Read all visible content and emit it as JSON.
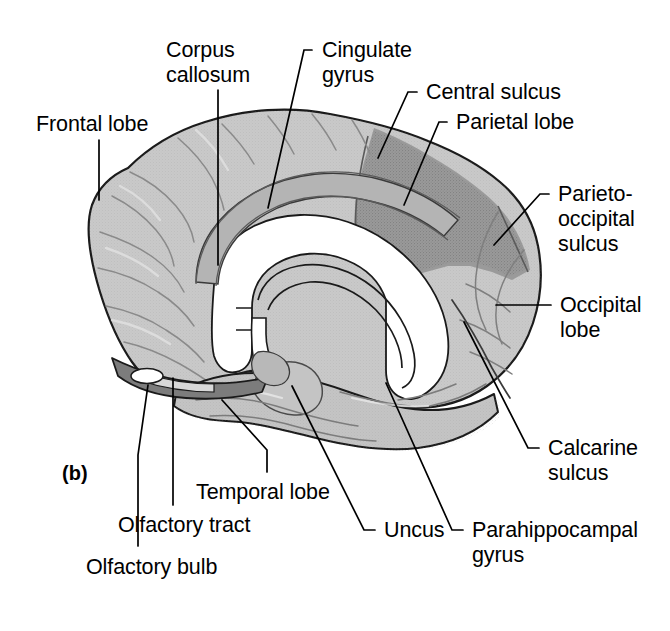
{
  "figure": {
    "panel_tag": "(b)",
    "background_color": "#ffffff"
  },
  "palette": {
    "outline": "#1a1a1a",
    "cortex_light": "#c9c9c9",
    "cortex_mid": "#bdbdbd",
    "parietal_dark": "#9a9a9a",
    "cingulate_band": "#b4b4b4",
    "white_matter": "#ffffff",
    "orbital_dark": "#7c7c7c",
    "sulcus_line": "#4a4a4a",
    "label_text": "#000000",
    "leader_line": "#000000"
  },
  "labels": [
    {
      "id": "frontal-lobe",
      "text": "Frontal lobe",
      "x": 36,
      "y": 112,
      "leader": "M 99,140 L 99,200"
    },
    {
      "id": "corpus-callosum",
      "text": "Corpus\ncallosum",
      "x": 166,
      "y": 38,
      "leader": "M 218,90 L 218,265"
    },
    {
      "id": "cingulate-gyrus",
      "text": "Cingulate\ngyrus",
      "x": 322,
      "y": 38,
      "leader": "M 312,50 L 304,50 L 268,208"
    },
    {
      "id": "central-sulcus",
      "text": "Central sulcus",
      "x": 426,
      "y": 80,
      "leader": "M 417,92 L 408,92 L 378,158"
    },
    {
      "id": "parietal-lobe",
      "text": "Parietal lobe",
      "x": 456,
      "y": 110,
      "leader": "M 447,122 L 439,122 L 404,205"
    },
    {
      "id": "parieto-occipital-sulcus",
      "text": "Parieto-\noccipital\nsulcus",
      "x": 558,
      "y": 182,
      "leader": "M 549,194 L 540,194 L 494,245"
    },
    {
      "id": "occipital-lobe",
      "text": "Occipital\nlobe",
      "x": 560,
      "y": 293,
      "leader": "M 551,305 L 496,305"
    },
    {
      "id": "calcarine-sulcus",
      "text": "Calcarine\nsulcus",
      "x": 548,
      "y": 436,
      "leader": "M 539,448 L 528,448 L 464,322"
    },
    {
      "id": "parahippocampal-gyrus",
      "text": "Parahippocampal\ngyrus",
      "x": 472,
      "y": 518,
      "leader": "M 463,530 L 452,530 L 386,383"
    },
    {
      "id": "uncus",
      "text": "Uncus",
      "x": 384,
      "y": 518,
      "leader": "M 375,530 L 364,530 L 292,386"
    },
    {
      "id": "temporal-lobe",
      "text": "Temporal lobe",
      "x": 196,
      "y": 480,
      "leader": "M 267,472 L 267,450 L 222,400"
    },
    {
      "id": "olfactory-tract",
      "text": "Olfactory tract",
      "x": 118,
      "y": 513,
      "leader": "M 173,505 L 173,378"
    },
    {
      "id": "olfactory-bulb",
      "text": "Olfactory bulb",
      "x": 86,
      "y": 555,
      "leader": "M 138,546 L 138,455 L 148,385"
    }
  ],
  "regions": [
    {
      "id": "frontal-lobe-region",
      "name": "Frontal lobe",
      "shade": "#c9c9c9"
    },
    {
      "id": "parietal-lobe-region",
      "name": "Parietal lobe",
      "shade": "#9a9a9a"
    },
    {
      "id": "occipital-lobe-region",
      "name": "Occipital lobe",
      "shade": "#c4c4c4"
    },
    {
      "id": "temporal-lobe-region",
      "name": "Temporal lobe",
      "shade": "#c4c4c4"
    },
    {
      "id": "cingulate-gyrus-region",
      "name": "Cingulate gyrus",
      "shade": "#b4b4b4"
    },
    {
      "id": "corpus-callosum-region",
      "name": "Corpus callosum",
      "shade": "#ffffff"
    },
    {
      "id": "orbital-surface-region",
      "name": "Orbital surface",
      "shade": "#7c7c7c"
    },
    {
      "id": "olfactory-bulb-region",
      "name": "Olfactory bulb",
      "shade": "#ffffff"
    }
  ]
}
